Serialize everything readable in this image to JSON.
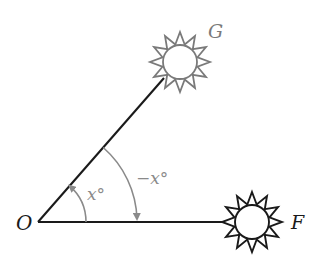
{
  "diagram": {
    "vertex": {
      "label": "O",
      "x": 38,
      "y": 222
    },
    "objects": [
      {
        "id": "G",
        "label": "G",
        "cx": 180,
        "cy": 62,
        "color": "#7a7a7a",
        "type": "sun"
      },
      {
        "id": "F",
        "label": "F",
        "cx": 252,
        "cy": 222,
        "color": "#1a1a1a",
        "type": "sun"
      }
    ],
    "angles": [
      {
        "label": "x°",
        "radius": 48,
        "direction": "counterclockwise",
        "from": "F",
        "to": "G",
        "color": "#888888"
      },
      {
        "label": "−x°",
        "radius": 99,
        "direction": "clockwise",
        "from": "G",
        "to": "F",
        "color": "#888888"
      }
    ],
    "colors": {
      "ray_line": "#1a1a1a",
      "arc": "#8a8a8a",
      "sun_g": "#7a7a7a",
      "sun_f": "#1a1a1a"
    }
  }
}
